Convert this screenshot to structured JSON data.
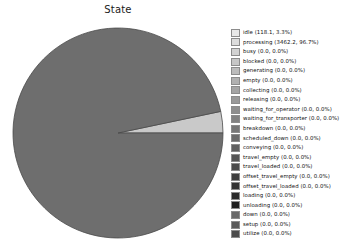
{
  "chart_data": {
    "type": "pie",
    "title": "State",
    "xlabel": "",
    "ylabel": "",
    "legend_position": "right",
    "grid": false,
    "categories": [
      "idle",
      "processing",
      "busy",
      "blocked",
      "generating",
      "empty",
      "collecting",
      "releasing",
      "waiting_for_operator",
      "waiting_for_transporter",
      "breakdown",
      "scheduled_down",
      "conveying",
      "travel_empty",
      "travel_loaded",
      "offset_travel_empty",
      "offset_travel_loaded",
      "loading",
      "unloading",
      "down",
      "setup",
      "utilize"
    ],
    "values": [
      118.1,
      3462.2,
      0.0,
      0.0,
      0.0,
      0.0,
      0.0,
      0.0,
      0.0,
      0.0,
      0.0,
      0.0,
      0.0,
      0.0,
      0.0,
      0.0,
      0.0,
      0.0,
      0.0,
      0.0,
      0.0,
      0.0
    ],
    "percents": [
      3.3,
      96.7,
      0.0,
      0.0,
      0.0,
      0.0,
      0.0,
      0.0,
      0.0,
      0.0,
      0.0,
      0.0,
      0.0,
      0.0,
      0.0,
      0.0,
      0.0,
      0.0,
      0.0,
      0.0,
      0.0,
      0.0
    ],
    "slice_colors": [
      "#c9c9c9",
      "#6e6e6e"
    ],
    "slice_edge_color": "#4a4a4a",
    "start_angle": 0,
    "total": 3580.3
  },
  "legend": {
    "entries": [
      {
        "label": "idle (118.1, 3.3%)",
        "color": "#e8e8e8"
      },
      {
        "label": "processing (3462.2, 96.7%)",
        "color": "#dcdcdc"
      },
      {
        "label": "busy (0.0, 0.0%)",
        "color": "#d2d2d2"
      },
      {
        "label": "blocked (0.0, 0.0%)",
        "color": "#c6c6c6"
      },
      {
        "label": "generating (0.0, 0.0%)",
        "color": "#bbbbbb"
      },
      {
        "label": "empty (0.0, 0.0%)",
        "color": "#b0b0b0"
      },
      {
        "label": "collecting (0.0, 0.0%)",
        "color": "#a4a4a4"
      },
      {
        "label": "releasing (0.0, 0.0%)",
        "color": "#999999"
      },
      {
        "label": "waiting_for_operator (0.0, 0.0%)",
        "color": "#8e8e8e"
      },
      {
        "label": "waiting_for_transporter (0.0, 0.0%)",
        "color": "#828282"
      },
      {
        "label": "breakdown (0.0, 0.0%)",
        "color": "#777777"
      },
      {
        "label": "scheduled_down (0.0, 0.0%)",
        "color": "#6b6b6b"
      },
      {
        "label": "conveying (0.0, 0.0%)",
        "color": "#606060"
      },
      {
        "label": "travel_empty (0.0, 0.0%)",
        "color": "#555555"
      },
      {
        "label": "travel_loaded (0.0, 0.0%)",
        "color": "#4a4a4a"
      },
      {
        "label": "offset_travel_empty (0.0, 0.0%)",
        "color": "#3f3f3f"
      },
      {
        "label": "offset_travel_loaded (0.0, 0.0%)",
        "color": "#343434"
      },
      {
        "label": "loading (0.0, 0.0%)",
        "color": "#2a2a2a"
      },
      {
        "label": "unloading (0.0, 0.0%)",
        "color": "#1f1f1f"
      },
      {
        "label": "down (0.0, 0.0%)",
        "color": "#6a6a6a"
      },
      {
        "label": "setup (0.0, 0.0%)",
        "color": "#5a5a5a"
      },
      {
        "label": "utilize (0.0, 0.0%)",
        "color": "#4c4c4c"
      }
    ]
  }
}
